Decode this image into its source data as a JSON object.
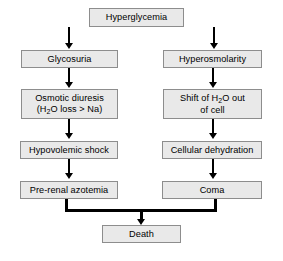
{
  "diagram": {
    "type": "flowchart",
    "colors": {
      "node_fill": "#e9e9e9",
      "node_border": "#8d8d8d",
      "connector": "#000000",
      "background": "#ffffff"
    },
    "nodes": {
      "hyperglycemia": {
        "label": "Hyperglycemia"
      },
      "glycosuria": {
        "label": "Glycosuria"
      },
      "hyperosmolarity": {
        "label": "Hyperosmolarity"
      },
      "osmotic_diuresis_line1": {
        "label": "Osmotic diuresis"
      },
      "osmotic_diuresis_line2_a": {
        "label": "(H"
      },
      "osmotic_diuresis_line2_sub": {
        "label": "2"
      },
      "osmotic_diuresis_line2_b": {
        "label": "O loss > Na)"
      },
      "shift_water_line1_a": {
        "label": "Shift of H"
      },
      "shift_water_line1_sub": {
        "label": "2"
      },
      "shift_water_line1_b": {
        "label": "O out"
      },
      "shift_water_line2": {
        "label": "of cell"
      },
      "hypovolemic_shock": {
        "label": "Hypovolemic shock"
      },
      "cellular_dehydration": {
        "label": "Cellular dehydration"
      },
      "prerenal_azotemia": {
        "label": "Pre-renal azotemia"
      },
      "coma": {
        "label": "Coma"
      },
      "death": {
        "label": "Death"
      }
    },
    "edges": [
      {
        "from": "hyperglycemia",
        "to": "glycosuria",
        "style": "arrow"
      },
      {
        "from": "hyperglycemia",
        "to": "hyperosmolarity",
        "style": "arrow"
      },
      {
        "from": "glycosuria",
        "to": "osmotic_diuresis",
        "style": "arrow"
      },
      {
        "from": "hyperosmolarity",
        "to": "shift_water",
        "style": "arrow"
      },
      {
        "from": "osmotic_diuresis",
        "to": "hypovolemic_shock",
        "style": "arrow"
      },
      {
        "from": "shift_water",
        "to": "cellular_dehydration",
        "style": "arrow"
      },
      {
        "from": "hypovolemic_shock",
        "to": "prerenal_azotemia",
        "style": "arrow"
      },
      {
        "from": "cellular_dehydration",
        "to": "coma",
        "style": "arrow"
      },
      {
        "from": "prerenal_azotemia",
        "to": "death",
        "style": "elbow-merge-arrow"
      },
      {
        "from": "coma",
        "to": "death",
        "style": "elbow-merge-arrow"
      }
    ]
  }
}
